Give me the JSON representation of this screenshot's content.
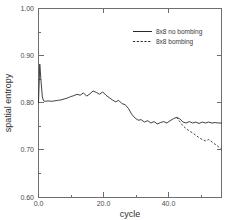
{
  "chart_data": {
    "type": "line",
    "title": "",
    "xlabel": "cycle",
    "ylabel": "spatial entropy",
    "xlim": [
      0.0,
      57.0
    ],
    "ylim": [
      0.6,
      1.0
    ],
    "xticks": [
      "0.0",
      "20.0",
      "40.0"
    ],
    "xtick_values": [
      0.0,
      20.0,
      40.0
    ],
    "yticks": [
      "0.60",
      "0.70",
      "0.80",
      "0.90",
      "1.00"
    ],
    "ytick_values": [
      0.6,
      0.7,
      0.8,
      0.9,
      1.0
    ],
    "grid": false,
    "legend_position": "upper right",
    "series": [
      {
        "name": "8x8 no bombing",
        "style": "solid",
        "color": "#2b2b2b",
        "x": [
          0.0,
          0.4,
          0.8,
          1.2,
          1.6,
          2.2,
          3.0,
          4.0,
          5.0,
          6.0,
          7.0,
          8.0,
          9.0,
          10.0,
          11.0,
          12.0,
          13.0,
          14.0,
          15.0,
          16.0,
          17.0,
          18.0,
          19.0,
          20.0,
          21.0,
          22.0,
          23.0,
          24.0,
          25.0,
          26.0,
          27.0,
          28.0,
          29.0,
          30.0,
          31.0,
          32.0,
          33.0,
          34.0,
          35.0,
          36.0,
          37.0,
          38.0,
          39.0,
          40.0,
          41.0,
          42.0,
          43.0,
          44.0,
          45.0,
          46.0,
          47.0,
          48.0,
          49.0,
          50.0,
          51.0,
          52.0,
          53.0,
          54.0,
          55.0,
          56.0,
          57.0
        ],
        "y": [
          0.8,
          0.882,
          0.845,
          0.812,
          0.804,
          0.803,
          0.804,
          0.803,
          0.804,
          0.805,
          0.806,
          0.808,
          0.81,
          0.813,
          0.815,
          0.818,
          0.816,
          0.821,
          0.814,
          0.819,
          0.825,
          0.822,
          0.818,
          0.823,
          0.816,
          0.811,
          0.806,
          0.802,
          0.805,
          0.798,
          0.796,
          0.788,
          0.776,
          0.768,
          0.763,
          0.764,
          0.759,
          0.762,
          0.757,
          0.76,
          0.755,
          0.758,
          0.76,
          0.757,
          0.762,
          0.766,
          0.769,
          0.766,
          0.759,
          0.757,
          0.76,
          0.757,
          0.759,
          0.756,
          0.759,
          0.757,
          0.759,
          0.757,
          0.758,
          0.757,
          0.757
        ]
      },
      {
        "name": "8x8 bombing",
        "style": "dashed",
        "color": "#2b2b2b",
        "x": [
          43.0,
          44.0,
          45.0,
          46.0,
          47.0,
          48.0,
          49.0,
          50.0,
          51.0,
          52.0,
          53.0,
          54.0,
          55.0,
          56.0,
          57.0
        ],
        "y": [
          0.769,
          0.76,
          0.751,
          0.745,
          0.74,
          0.736,
          0.731,
          0.726,
          0.722,
          0.719,
          0.722,
          0.717,
          0.712,
          0.707,
          0.702
        ]
      }
    ]
  },
  "legend": {
    "entries": [
      {
        "label": "8x8 no bombing",
        "style": "solid"
      },
      {
        "label": "8x8 bombing",
        "style": "dashed"
      }
    ]
  },
  "axes": {
    "x_title": "cycle",
    "y_title": "spatial entropy",
    "x_tick_labels": [
      "0.0",
      "20.0",
      "40.0"
    ],
    "y_tick_labels": [
      "1.00",
      "0.90",
      "0.80",
      "0.70",
      "0.60"
    ]
  },
  "colors": {
    "background": "#ffffff",
    "frame": "#6e6e6e",
    "line": "#2b2b2b",
    "text": "#3a3a3a"
  }
}
